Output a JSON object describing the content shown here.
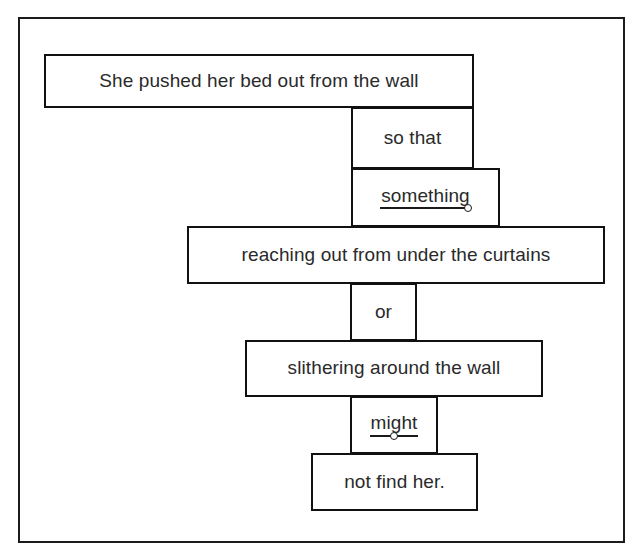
{
  "diagram": {
    "type": "sentence-box-diagram",
    "frame": {
      "border_color": "#1b1b1b"
    },
    "text_color": "#2a2a2a",
    "box_border_color": "#111111",
    "boxes": [
      {
        "id": "main-clause",
        "text": "She pushed her bed out from the wall",
        "underlined": false,
        "dot": "none",
        "x": 42,
        "y": 52,
        "w": 430,
        "h": 54
      },
      {
        "id": "subordinator",
        "text": "so that",
        "underlined": false,
        "dot": "none",
        "x": 349,
        "y": 105,
        "w": 123,
        "h": 62
      },
      {
        "id": "subject",
        "text": "something",
        "underlined": true,
        "dot": "right",
        "x": 349,
        "y": 166,
        "w": 149,
        "h": 59
      },
      {
        "id": "participial-phrase-1",
        "text": "reaching out from under the curtains",
        "underlined": false,
        "dot": "none",
        "x": 185,
        "y": 224,
        "w": 418,
        "h": 58
      },
      {
        "id": "conjunction",
        "text": "or",
        "underlined": false,
        "dot": "none",
        "x": 348,
        "y": 281,
        "w": 67,
        "h": 58
      },
      {
        "id": "participial-phrase-2",
        "text": "slithering around the wall",
        "underlined": false,
        "dot": "none",
        "x": 243,
        "y": 338,
        "w": 298,
        "h": 57
      },
      {
        "id": "modal-verb",
        "text": "might",
        "underlined": true,
        "dot": "center",
        "x": 348,
        "y": 394,
        "w": 88,
        "h": 58
      },
      {
        "id": "predicate",
        "text": "not find her.",
        "underlined": false,
        "dot": "none",
        "x": 309,
        "y": 451,
        "w": 167,
        "h": 58
      }
    ]
  }
}
